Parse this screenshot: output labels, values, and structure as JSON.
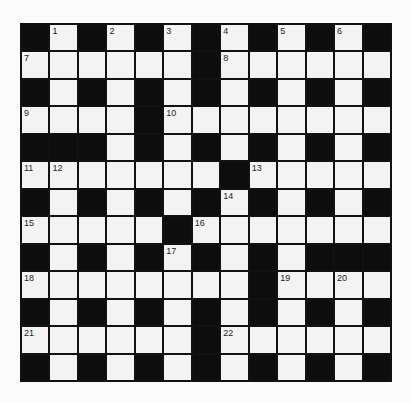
{
  "puzzle": {
    "rows": 13,
    "cols": 13,
    "colors": {
      "block": "#0d0d0d",
      "cell": "#f3f3f3",
      "line": "#111111",
      "background": "#fbfbfb",
      "number": "#222222"
    },
    "layout": [
      "#.#.#.#.#.#.#",
      "......#......",
      "#.#.#.#.#.#.#",
      "....#........",
      "###.#.#.#.#.#",
      ".......#.....",
      "#.#.#.#.#.#.#",
      ".....#.......",
      "#.#.#.#.#.###",
      "........#....",
      "#.#.#.#.#.#.#",
      "......#......",
      "#.#.#.#.#.#.#"
    ],
    "numbers": [
      {
        "r": 0,
        "c": 1,
        "n": "1"
      },
      {
        "r": 0,
        "c": 3,
        "n": "2"
      },
      {
        "r": 0,
        "c": 5,
        "n": "3"
      },
      {
        "r": 0,
        "c": 7,
        "n": "4"
      },
      {
        "r": 0,
        "c": 9,
        "n": "5"
      },
      {
        "r": 0,
        "c": 11,
        "n": "6"
      },
      {
        "r": 1,
        "c": 0,
        "n": "7"
      },
      {
        "r": 1,
        "c": 7,
        "n": "8"
      },
      {
        "r": 3,
        "c": 0,
        "n": "9"
      },
      {
        "r": 3,
        "c": 5,
        "n": "10"
      },
      {
        "r": 5,
        "c": 0,
        "n": "11"
      },
      {
        "r": 5,
        "c": 1,
        "n": "12"
      },
      {
        "r": 5,
        "c": 8,
        "n": "13"
      },
      {
        "r": 6,
        "c": 7,
        "n": "14"
      },
      {
        "r": 7,
        "c": 0,
        "n": "15"
      },
      {
        "r": 7,
        "c": 6,
        "n": "16"
      },
      {
        "r": 8,
        "c": 5,
        "n": "17"
      },
      {
        "r": 9,
        "c": 0,
        "n": "18"
      },
      {
        "r": 9,
        "c": 9,
        "n": "19"
      },
      {
        "r": 9,
        "c": 11,
        "n": "20"
      },
      {
        "r": 11,
        "c": 0,
        "n": "21"
      },
      {
        "r": 11,
        "c": 7,
        "n": "22"
      }
    ],
    "fills": []
  }
}
